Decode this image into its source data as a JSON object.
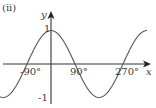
{
  "label": "(ii)",
  "chart_data": {
    "type": "line",
    "title": "",
    "function": "y = cos x",
    "xlabel": "x",
    "ylabel": "y",
    "x_ticks": [
      "-90°",
      "90°",
      "270°"
    ],
    "y_ticks": [
      "1",
      "-1"
    ],
    "xlim": [
      -180,
      360
    ],
    "ylim": [
      -1,
      1
    ],
    "grid": false,
    "series": [
      {
        "name": "cos x",
        "x": [
          -180,
          -135,
          -90,
          -45,
          0,
          45,
          90,
          135,
          180,
          225,
          270,
          315,
          360
        ],
        "values": [
          -1,
          -0.707,
          0,
          0.707,
          1,
          0.707,
          0,
          -0.707,
          -1,
          -0.707,
          0,
          0.707,
          1
        ]
      }
    ]
  },
  "colors": {
    "curve": "#555555",
    "axes": "#333333",
    "text": "#3a3a3a"
  }
}
